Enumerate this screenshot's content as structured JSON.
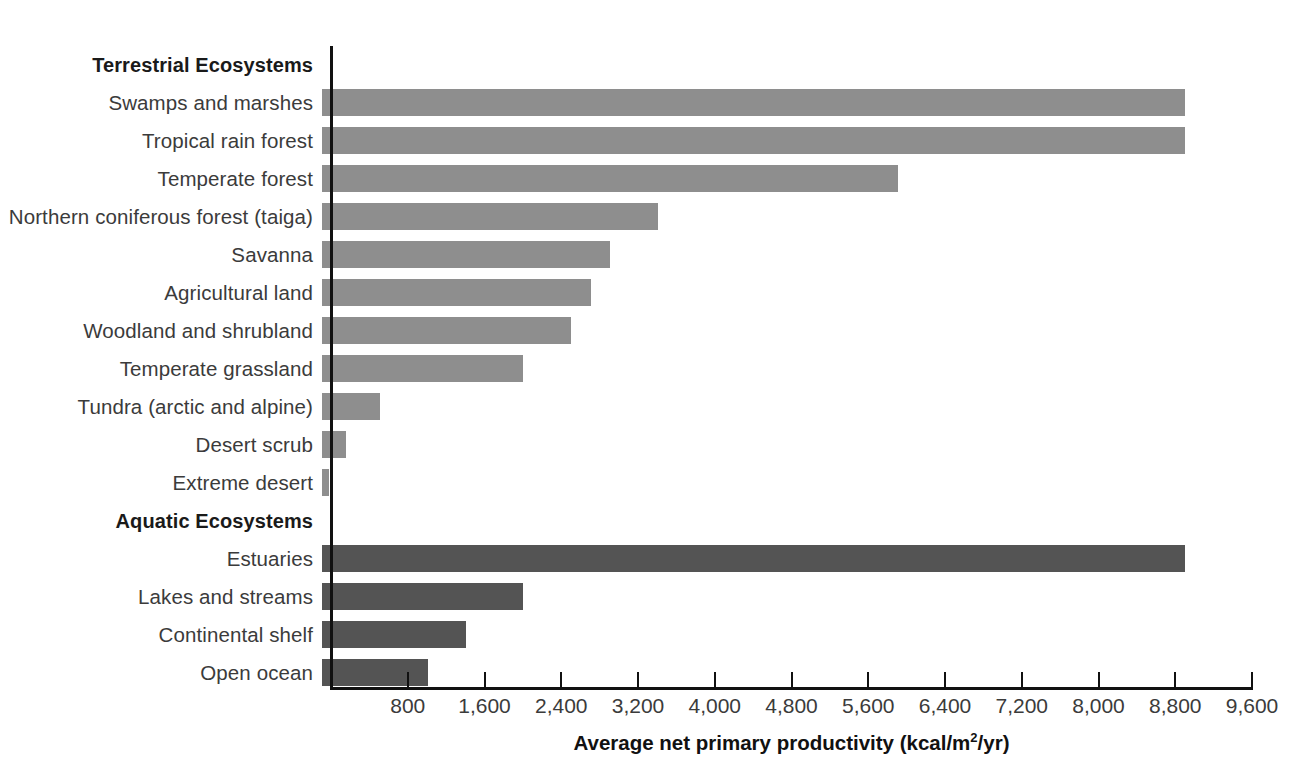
{
  "chart_data": {
    "type": "bar",
    "orientation": "horizontal",
    "title": "",
    "xlabel": "Average net primary productivity (kcal/m2/yr)",
    "xlabel_parts": {
      "pre": "Average net primary productivity (kcal/m",
      "sup": "2",
      "post": "/yr)"
    },
    "ylabel": "",
    "xlim": [
      0,
      9600
    ],
    "xticks": [
      800,
      1600,
      2400,
      3200,
      4000,
      4800,
      5600,
      6400,
      7200,
      8000,
      8800,
      9600
    ],
    "xtick_labels": [
      "800",
      "1,600",
      "2,400",
      "3,200",
      "4,000",
      "4,800",
      "5,600",
      "6,400",
      "7,200",
      "8,000",
      "8,800",
      "9,600"
    ],
    "grid": false,
    "legend": false,
    "groups": [
      {
        "name": "Terrestrial Ecosystems",
        "color": "#8e8e8e",
        "categories": [
          "Swamps and marshes",
          "Tropical rain forest",
          "Temperate forest",
          "Northern coniferous forest (taiga)",
          "Savanna",
          "Agricultural land",
          "Woodland and shrubland",
          "Temperate grassland",
          "Tundra (arctic and alpine)",
          "Desert scrub",
          "Extreme desert"
        ],
        "values": [
          9000,
          9000,
          6000,
          3500,
          3000,
          2800,
          2600,
          2100,
          600,
          250,
          70
        ]
      },
      {
        "name": "Aquatic Ecosystems",
        "color": "#545454",
        "categories": [
          "Estuaries",
          "Lakes and streams",
          "Continental shelf",
          "Open ocean"
        ],
        "values": [
          9000,
          2100,
          1500,
          1100
        ]
      }
    ],
    "categories": [
      "Swamps and marshes",
      "Tropical rain forest",
      "Temperate forest",
      "Northern coniferous forest (taiga)",
      "Savanna",
      "Agricultural land",
      "Woodland and shrubland",
      "Temperate grassland",
      "Tundra (arctic and alpine)",
      "Desert scrub",
      "Extreme desert",
      "Estuaries",
      "Lakes and streams",
      "Continental shelf",
      "Open ocean"
    ],
    "values": [
      9000,
      9000,
      6000,
      3500,
      3000,
      2800,
      2600,
      2100,
      600,
      250,
      70,
      9000,
      2100,
      1500,
      1100
    ]
  },
  "colors": {
    "terrestrial_bar": "#8e8e8e",
    "aquatic_bar": "#545454",
    "axis": "#111111",
    "label_text": "#3b3b3b",
    "heading_text": "#1a1a1a",
    "background": "#ffffff"
  }
}
